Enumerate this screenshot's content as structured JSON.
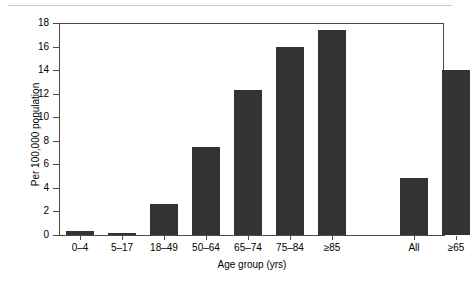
{
  "chart_data": {
    "type": "bar",
    "title": "",
    "subtitle": "",
    "xlabel": "Age group (yrs)",
    "ylabel": "Per 100,000 population",
    "categories": [
      "0–4",
      "5–17",
      "18–49",
      "50–64",
      "65–74",
      "75–84",
      "≥85",
      "All",
      "≥65"
    ],
    "values": [
      0.3,
      0.15,
      2.6,
      7.5,
      12.3,
      16.0,
      17.4,
      4.8,
      14.0
    ],
    "ylim": [
      0,
      18
    ],
    "ytick_labels": [
      "0",
      "2",
      "4",
      "6",
      "8",
      "10",
      "12",
      "14",
      "16",
      "18"
    ],
    "ytick_values": [
      0,
      2,
      4,
      6,
      8,
      10,
      12,
      14,
      16,
      18
    ],
    "grid": false,
    "legend": null,
    "bar_color": "#333333",
    "axis_color": "#4a4a4a",
    "rule_color": "#c9c9c9",
    "gap_after_index": 6,
    "annotations": []
  },
  "figure": {
    "background": "#ffffff",
    "top_rule_present": true
  }
}
